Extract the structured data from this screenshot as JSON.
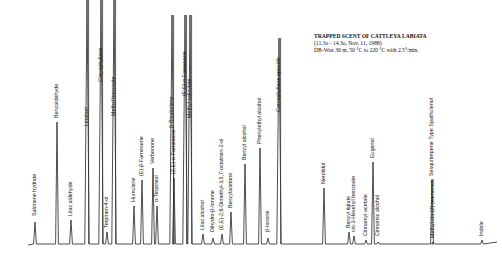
{
  "chart_data": {
    "type": "line",
    "title": "TRAPPED SCENT OF CATTLEYA LABIATA",
    "subtitle_lines": [
      "(11.3o - 14.3o, Nov. 11, 1988)",
      "DB-Wax 30 m, 50 °C to 220 °C with 2.5°/min."
    ],
    "xlabel": "",
    "ylabel": "",
    "grid": false,
    "baseline_y": 244,
    "peaks": [
      {
        "x": 35,
        "top": 222,
        "label": "Sabinene hydrate",
        "label_y": 216
      },
      {
        "x": 57,
        "top": 122,
        "label": "Benzaldehyde",
        "label_y": 118
      },
      {
        "x": 71,
        "top": 220,
        "label": "Lilac aldehyde",
        "label_y": 216
      },
      {
        "x": 87,
        "top": 0,
        "label": "Linalool",
        "label_y": 126
      },
      {
        "x": 101,
        "top": 0,
        "label": "Caryophyllene",
        "label_y": 82
      },
      {
        "x": 107,
        "top": 232,
        "label": "Terpinen-4-ol",
        "label_y": 228
      },
      {
        "x": 114,
        "top": 0,
        "label": "Methyl benzoate",
        "label_y": 116
      },
      {
        "x": 134,
        "top": 206,
        "label": "Humulene",
        "label_y": 202
      },
      {
        "x": 142,
        "top": 180,
        "label": "(E)-β-Farnesene",
        "label_y": 176
      },
      {
        "x": 153,
        "top": 168,
        "label": "Verbenone",
        "label_y": 164
      },
      {
        "x": 157,
        "top": 206,
        "label": "α-Terpineol",
        "label_y": 202
      },
      {
        "x": 172,
        "top": 15,
        "label": "β-Bisabolene",
        "label_y": 128
      },
      {
        "x": 174,
        "top": 178,
        "label": "(Z,E)-α-Farnesene",
        "label_y": 174
      },
      {
        "x": 185,
        "top": 15,
        "label": "(E,E)-α-Farnesene",
        "label_y": 96
      },
      {
        "x": 190,
        "top": 15,
        "label": "Methyl salicylate",
        "label_y": 118
      },
      {
        "x": 203,
        "top": 234,
        "label": "Lilac alcohol",
        "label_y": 230
      },
      {
        "x": 213,
        "top": 238,
        "label": "Dihydro-β-Ionone",
        "label_y": 232
      },
      {
        "x": 222,
        "top": 234,
        "label": "(E,E)-2,6-Dimethyl-3,5,7-octatrien-2-ol",
        "label_y": 230
      },
      {
        "x": 231,
        "top": 212,
        "label": "Benzylacetone",
        "label_y": 208
      },
      {
        "x": 245,
        "top": 164,
        "label": "Benzyl alcohol",
        "label_y": 160
      },
      {
        "x": 260,
        "top": 148,
        "label": "Phenylethyl alcohol",
        "label_y": 144
      },
      {
        "x": 268,
        "top": 238,
        "label": "β-Ionone",
        "label_y": 232
      },
      {
        "x": 279,
        "top": 38,
        "label": "Caryophyllene epoxide",
        "label_y": 112
      },
      {
        "x": 324,
        "top": 188,
        "label": "Nerolidol",
        "label_y": 184
      },
      {
        "x": 349,
        "top": 232,
        "label": "Benzyl tiglate",
        "label_y": 228
      },
      {
        "x": 354,
        "top": 236,
        "label": "cis-3-Hexenyl benzoate",
        "label_y": 232
      },
      {
        "x": 366,
        "top": 240,
        "label": "Cinnamyl acetate",
        "label_y": 236
      },
      {
        "x": 373,
        "top": 162,
        "label": "Eugenol",
        "label_y": 158
      },
      {
        "x": 378,
        "top": 242,
        "label": "Cinnamic alcohol",
        "label_y": 236
      },
      {
        "x": 432,
        "top": 180,
        "label": "Sesquiterpene Type Spathulenol",
        "label_y": 176
      },
      {
        "x": 433,
        "top": 242,
        "label": "Methyl cis-(Z)-jasmonate",
        "label_y": 238
      },
      {
        "x": 482,
        "top": 240,
        "label": "Indole",
        "label_y": 236
      }
    ]
  },
  "header": {
    "title": "TRAPPED SCENT OF CATTLEYA LABIATA",
    "line2": "(11.3o - 14.3o, Nov. 11, 1988)",
    "line3": "DB-Wax 30 m, 50 °C to 220 °C with 2.5°/min."
  }
}
